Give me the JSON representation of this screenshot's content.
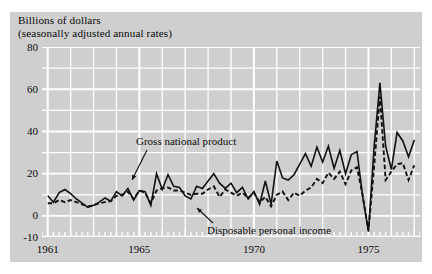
{
  "figure": {
    "title_line1": "Billions of dollars",
    "title_line2": "(seasonally adjusted annual rates)",
    "background_color": "#cfcfcf",
    "grid_color": "#ffffff",
    "ink_color": "#111111"
  },
  "annotations": {
    "gross_national_product": "Gross national product",
    "disposable_personal_income": "Disposable personal income"
  },
  "axes": {
    "y_ticks": [
      "80",
      "60",
      "40",
      "20",
      "0",
      "-10"
    ],
    "x_ticks": [
      "1961",
      "1965",
      "1970",
      "1975"
    ]
  },
  "chart_data": {
    "type": "line",
    "title": "Billions of dollars (seasonally adjusted annual rates)",
    "subtitle": "(seasonally adjusted annual rates)",
    "xlabel": "",
    "ylabel": "Billions of dollars",
    "ylim": [
      -10,
      80
    ],
    "xlim": [
      1960.75,
      1977.25
    ],
    "ytick_values": [
      80,
      60,
      40,
      20,
      0,
      -10
    ],
    "ytick_labels": [
      "80",
      "60",
      "40",
      "20",
      "0",
      "-10"
    ],
    "xtick_values": [
      1961,
      1965,
      1970,
      1975
    ],
    "xtick_labels": [
      "1961",
      "1965",
      "1970",
      "1975"
    ],
    "minor_xticks": "quarterly",
    "grid": true,
    "grid_orientation": "both",
    "legend": "inline-annotations",
    "series": [
      {
        "name": "Gross national product",
        "style": "solid",
        "color": "#111111",
        "x": [
          1961.0,
          1961.25,
          1961.5,
          1961.75,
          1962.0,
          1962.25,
          1962.5,
          1962.75,
          1963.0,
          1963.25,
          1963.5,
          1963.75,
          1964.0,
          1964.25,
          1964.5,
          1964.75,
          1965.0,
          1965.25,
          1965.5,
          1965.75,
          1966.0,
          1966.25,
          1966.5,
          1966.75,
          1967.0,
          1967.25,
          1967.5,
          1967.75,
          1968.0,
          1968.25,
          1968.5,
          1968.75,
          1969.0,
          1969.25,
          1969.5,
          1969.75,
          1970.0,
          1970.25,
          1970.5,
          1970.75,
          1971.0,
          1971.25,
          1971.5,
          1971.75,
          1972.0,
          1972.25,
          1972.5,
          1972.75,
          1973.0,
          1973.25,
          1973.5,
          1973.75,
          1974.0,
          1974.25,
          1974.5,
          1974.75,
          1975.0,
          1975.25,
          1975.5,
          1975.75,
          1976.0,
          1976.25,
          1976.5,
          1976.75,
          1977.0
        ],
        "y": [
          9.5,
          6.5,
          11.0,
          12.5,
          10.5,
          8.0,
          6.0,
          4.0,
          5.0,
          6.5,
          8.5,
          7.0,
          11.5,
          9.5,
          13.0,
          7.5,
          12.0,
          11.5,
          5.0,
          20.0,
          12.5,
          19.5,
          14.0,
          13.5,
          9.5,
          8.0,
          14.0,
          13.0,
          16.5,
          20.0,
          15.5,
          13.0,
          15.5,
          11.0,
          13.5,
          8.0,
          11.5,
          5.5,
          16.5,
          5.5,
          26.0,
          18.0,
          17.0,
          19.5,
          24.5,
          29.5,
          23.5,
          32.5,
          25.5,
          33.0,
          22.5,
          31.0,
          20.0,
          29.0,
          30.5,
          9.0,
          -7.5,
          33.0,
          63.0,
          33.0,
          22.0,
          39.5,
          35.5,
          28.0,
          36.0
        ]
      },
      {
        "name": "Disposable personal income",
        "style": "dashed",
        "color": "#111111",
        "x": [
          1961.0,
          1961.25,
          1961.5,
          1961.75,
          1962.0,
          1962.25,
          1962.5,
          1962.75,
          1963.0,
          1963.25,
          1963.5,
          1963.75,
          1964.0,
          1964.25,
          1964.5,
          1964.75,
          1965.0,
          1965.25,
          1965.5,
          1965.75,
          1966.0,
          1966.25,
          1966.5,
          1966.75,
          1967.0,
          1967.25,
          1967.5,
          1967.75,
          1968.0,
          1968.25,
          1968.5,
          1968.75,
          1969.0,
          1969.25,
          1969.5,
          1969.75,
          1970.0,
          1970.25,
          1970.5,
          1970.75,
          1971.0,
          1971.25,
          1971.5,
          1971.75,
          1972.0,
          1972.25,
          1972.5,
          1972.75,
          1973.0,
          1973.25,
          1973.5,
          1973.75,
          1974.0,
          1974.25,
          1974.5,
          1974.75,
          1975.0,
          1975.25,
          1975.5,
          1975.75,
          1976.0,
          1976.25,
          1976.5,
          1976.75,
          1977.0
        ],
        "y": [
          6.0,
          6.0,
          7.5,
          6.5,
          7.5,
          6.5,
          5.5,
          4.5,
          5.0,
          6.0,
          6.5,
          7.0,
          9.5,
          10.0,
          11.5,
          8.0,
          12.0,
          11.0,
          6.0,
          12.0,
          13.0,
          13.5,
          12.0,
          12.0,
          11.0,
          10.0,
          10.5,
          10.5,
          12.5,
          14.0,
          9.0,
          12.5,
          11.0,
          9.5,
          11.0,
          8.5,
          11.0,
          6.5,
          9.0,
          4.5,
          10.0,
          11.5,
          7.5,
          11.0,
          9.5,
          12.0,
          13.5,
          17.5,
          15.5,
          20.5,
          17.5,
          21.0,
          15.0,
          21.5,
          23.0,
          9.5,
          -7.0,
          24.0,
          56.5,
          17.0,
          21.0,
          24.5,
          25.0,
          17.0,
          24.0
        ]
      }
    ]
  }
}
